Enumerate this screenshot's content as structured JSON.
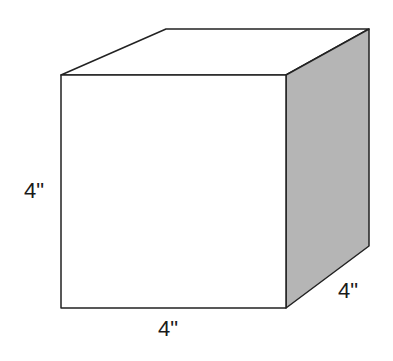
{
  "diagram": {
    "shape": "cube",
    "colors": {
      "stroke": "#222222",
      "front_fill": "#ffffff",
      "top_fill": "#ffffff",
      "side_fill": "#b5b5b5"
    },
    "labels": {
      "height": "4\"",
      "width": "4\"",
      "depth": "4\""
    }
  }
}
